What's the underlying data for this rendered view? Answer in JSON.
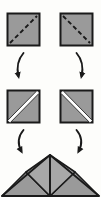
{
  "diagram": {
    "type": "origami-fold-instructions",
    "canvas": {
      "width": 101,
      "height": 197
    },
    "colors": {
      "background": "#fdfdfb",
      "paper_fill": "#9a9a9a",
      "paper_fill_light": "#a8a8a8",
      "outline": "#1a1a1a",
      "crease_white": "#ffffff",
      "dashed_fold": "#1a1a1a",
      "arrow": "#1a1a1a"
    },
    "steps": [
      {
        "index": 1,
        "name": "step-1-squares-with-dashed-folds",
        "label": "Squares with dashed diagonal fold lines",
        "shapes": [
          {
            "name": "top-left-square",
            "kind": "square",
            "x": 7,
            "y": 13,
            "size": 33,
            "fold_line": "bottom-left-to-top-right",
            "fold_style": "dashed"
          },
          {
            "name": "top-right-square",
            "kind": "square",
            "x": 60,
            "y": 13,
            "size": 33,
            "fold_line": "top-left-to-bottom-right",
            "fold_style": "dashed"
          }
        ]
      },
      {
        "index": 2,
        "name": "step-2-squares-with-creases",
        "label": "Folded squares showing white crease band",
        "shapes": [
          {
            "name": "middle-left-square",
            "kind": "square",
            "x": 7,
            "y": 90,
            "size": 33,
            "fold_line": "bottom-left-to-top-right",
            "fold_style": "solid-white-band"
          },
          {
            "name": "middle-right-square",
            "kind": "square",
            "x": 60,
            "y": 90,
            "size": 33,
            "fold_line": "top-left-to-bottom-right",
            "fold_style": "solid-white-band"
          }
        ]
      },
      {
        "index": 3,
        "name": "step-3-assembled-triangle",
        "label": "Assembled subdivided triangle",
        "shapes": [
          {
            "name": "final-triangle",
            "kind": "triangle",
            "apex_x": 50,
            "apex_y": 155,
            "base_left_x": 2,
            "base_right_x": 99,
            "base_y": 196,
            "subdivisions": [
              "left-outer-triangle",
              "center-left-triangle",
              "center-right-triangle",
              "right-outer-triangle"
            ]
          }
        ]
      }
    ],
    "arrows": [
      {
        "name": "arrow-left-step1-to-step2",
        "direction": "down-curving-left",
        "from_step": 1,
        "to_step": 2
      },
      {
        "name": "arrow-right-step1-to-step2",
        "direction": "down-curving-right",
        "from_step": 1,
        "to_step": 2
      },
      {
        "name": "arrow-left-step2-to-step3",
        "direction": "down-curving-left",
        "from_step": 2,
        "to_step": 3
      },
      {
        "name": "arrow-right-step2-to-step3",
        "direction": "down-curving-right",
        "from_step": 2,
        "to_step": 3
      }
    ]
  }
}
